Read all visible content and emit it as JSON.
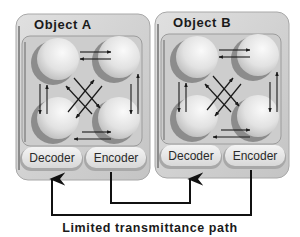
{
  "diagram": {
    "objects": [
      {
        "id": "A",
        "title": "Object A",
        "units": [
          "top-left",
          "top-right",
          "bottom-left",
          "bottom-right"
        ],
        "decoder_label": "Decoder",
        "encoder_label": "Encoder"
      },
      {
        "id": "B",
        "title": "Object B",
        "units": [
          "top-left",
          "top-right",
          "bottom-left",
          "bottom-right"
        ],
        "decoder_label": "Decoder",
        "encoder_label": "Encoder"
      }
    ],
    "connections": [
      {
        "from": "Object A Encoder",
        "to": "Object B Decoder"
      },
      {
        "from": "Object B Encoder",
        "to": "Object A Decoder"
      }
    ],
    "caption": "Limited transmittance path"
  },
  "colors": {
    "panel": "#d4d4d4",
    "panel_edge": "#9a9a9a",
    "inner_frame": "#c6c6c6",
    "ball_light": "#f2f2f2",
    "ball_shadow": "#8a8a8a",
    "arrow": "#1a1a1a"
  }
}
